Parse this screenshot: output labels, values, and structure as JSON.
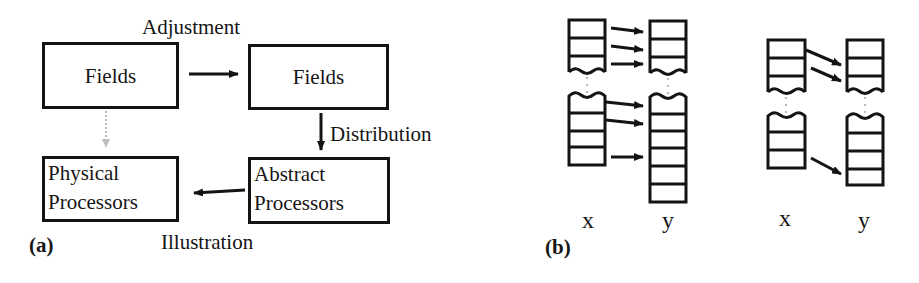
{
  "figure": {
    "panel_a": {
      "label": "(a)",
      "boxes": [
        {
          "id": "fields-source",
          "lines": [
            "Fields"
          ]
        },
        {
          "id": "fields-adjusted",
          "lines": [
            "Fields"
          ]
        },
        {
          "id": "physical-processors",
          "lines": [
            "Physical",
            "Processors"
          ]
        },
        {
          "id": "abstract-processors",
          "lines": [
            "Abstract",
            "Processors"
          ]
        }
      ],
      "edges": [
        {
          "from": "fields-source",
          "to": "fields-adjusted",
          "label": "Adjustment",
          "style": "solid"
        },
        {
          "from": "fields-adjusted",
          "to": "abstract-processors",
          "label": "Distribution",
          "style": "solid"
        },
        {
          "from": "abstract-processors",
          "to": "physical-processors",
          "label": "Illustration",
          "style": "solid"
        },
        {
          "from": "fields-source",
          "to": "physical-processors",
          "label": "",
          "style": "dotted-gray"
        }
      ]
    },
    "panel_b": {
      "label": "(b)",
      "groups": [
        {
          "source_label": "x",
          "target_label": "y",
          "mapping": "aligned"
        },
        {
          "source_label": "x",
          "target_label": "y",
          "mapping": "shifted"
        }
      ]
    },
    "colors": {
      "ink": "#141414",
      "dotted_arrow": "#bdbdbd",
      "background": "#ffffff"
    }
  }
}
